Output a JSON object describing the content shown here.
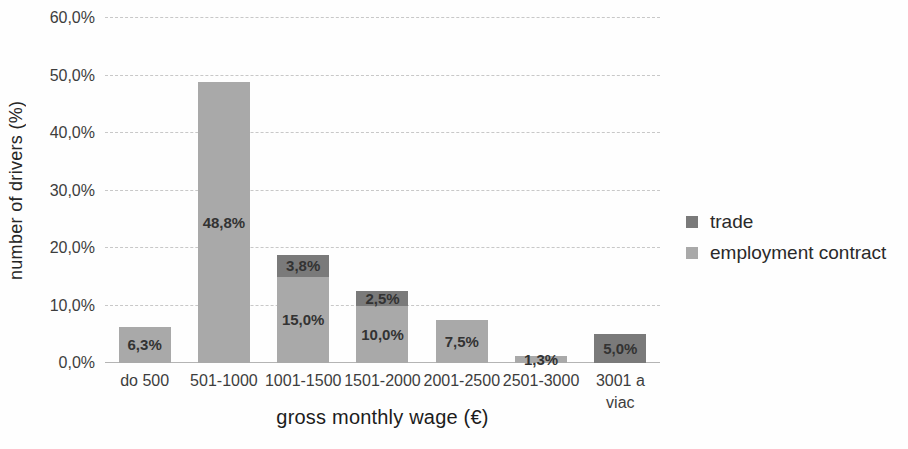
{
  "figure": {
    "background": "#fefefe"
  },
  "chart_data": {
    "type": "bar",
    "stacked": true,
    "title": "",
    "xlabel": "gross monthly wage (€)",
    "ylabel": "number of drivers (%)",
    "categories": [
      "do 500",
      "501-1000",
      "1001-1500",
      "1501-2000",
      "2001-2500",
      "2501-3000",
      "3001 a viac"
    ],
    "xtick_labels": [
      "do 500",
      "501-1000",
      "1001-1500",
      "1501-2000",
      "2001-2500",
      "2501-3000",
      "3001 a\nviac"
    ],
    "yticks": [
      "0,0%",
      "10,0%",
      "20,0%",
      "30,0%",
      "40,0%",
      "50,0%",
      "60,0%"
    ],
    "ylim": [
      0,
      60
    ],
    "grid": "horizontal-dashed",
    "legend_position": "right-middle",
    "series": [
      {
        "name": "trade",
        "color": "#7a7a7a",
        "values": [
          0,
          0,
          3.8,
          2.5,
          0,
          0,
          5.0
        ],
        "data_labels": [
          "",
          "",
          "3,8%",
          "2,5%",
          "",
          "",
          "5,0%"
        ]
      },
      {
        "name": "employment contract",
        "color": "#a9a9a9",
        "values": [
          6.3,
          48.8,
          15.0,
          10.0,
          7.5,
          1.3,
          0
        ],
        "data_labels": [
          "6,3%",
          "48,8%",
          "15,0%",
          "10,0%",
          "7,5%",
          "1,3%",
          ""
        ]
      }
    ],
    "label_color": "#333333",
    "grid_color": "#c8c8c8",
    "axis_line_color": "#b4b4b4",
    "axis_text_color": "#3d3d3d"
  }
}
